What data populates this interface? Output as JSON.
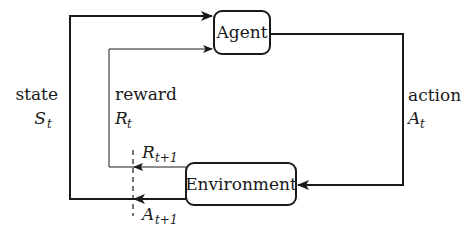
{
  "diagram": {
    "nodes": {
      "agent": {
        "label": "Agent"
      },
      "environment": {
        "label": "Environment"
      }
    },
    "edges": {
      "state": {
        "label": "state",
        "symbol": "S",
        "subscript": "t",
        "from": "environment",
        "to": "agent"
      },
      "reward": {
        "label": "reward",
        "symbol": "R",
        "subscript": "t",
        "from": "environment",
        "to": "agent"
      },
      "action": {
        "label": "action",
        "symbol": "A",
        "subscript": "t",
        "from": "agent",
        "to": "environment"
      }
    },
    "next_step": {
      "reward": {
        "symbol": "R",
        "subscript": "t+1"
      },
      "state": {
        "symbol": "A",
        "subscript": "t+1"
      }
    },
    "colors": {
      "stroke": "#1a1a1a",
      "background": "#ffffff"
    }
  }
}
